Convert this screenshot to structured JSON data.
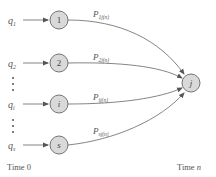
{
  "diagram": {
    "sources": [
      {
        "id": "1",
        "input": "q",
        "input_sub": "1",
        "prob": "P",
        "prob_sub": "1j(n)",
        "y": 20
      },
      {
        "id": "2",
        "input": "q",
        "input_sub": "2",
        "prob": "P",
        "prob_sub": "2j(n)",
        "y": 63
      },
      {
        "id": "i",
        "input": "q",
        "input_sub": "i",
        "prob": "P",
        "prob_sub": "ij(n)",
        "y": 104
      },
      {
        "id": "s",
        "input": "q",
        "input_sub": "s",
        "prob": "P",
        "prob_sub": "sj(n)",
        "y": 145
      }
    ],
    "target": {
      "id": "j"
    },
    "time_labels": {
      "start": "Time 0",
      "end_prefix": "Time ",
      "end_var": "n"
    },
    "colors": {
      "node_fill": "#d9d9d9",
      "stroke": "#666666"
    }
  }
}
